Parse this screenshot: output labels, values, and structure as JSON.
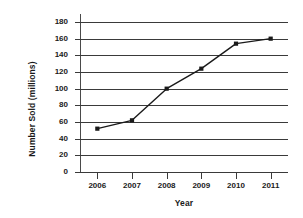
{
  "chart_data": {
    "type": "line",
    "title": "",
    "xlabel": "Year",
    "ylabel": "Number Sold (millions)",
    "categories": [
      "2006",
      "2007",
      "2008",
      "2009",
      "2010",
      "2011"
    ],
    "values": [
      52,
      62,
      100,
      124,
      154,
      160
    ],
    "series": [
      {
        "name": "Number Sold",
        "values": [
          52,
          62,
          100,
          124,
          154,
          160
        ]
      }
    ],
    "ylim": [
      0,
      180
    ],
    "yticks": [
      0,
      20,
      40,
      60,
      80,
      100,
      120,
      140,
      160,
      180
    ],
    "ytick_labels": [
      "0",
      "20",
      "40",
      "60",
      "80",
      "100",
      "120",
      "140",
      "160",
      "180"
    ],
    "grid": "horizontal",
    "legend": "none",
    "line_color": "#1a1a1a",
    "marker": "square",
    "marker_color": "#1a1a1a",
    "background_color": "#ffffff",
    "axis_color": "#3a3a3a"
  }
}
